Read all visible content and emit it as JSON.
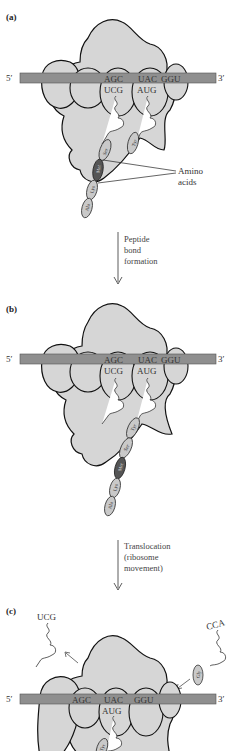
{
  "colors": {
    "ribosome_fill": "#d6d6d6",
    "ribosome_stroke": "#111111",
    "mrna_fill": "#8f8f8f",
    "mrna_stroke": "#555555",
    "amino_fill": "#c9c9c9",
    "met_fill": "#555555",
    "trna_fill": "#ffffff",
    "text": "#333333"
  },
  "panels": [
    {
      "label": "(a)",
      "mrna": {
        "five_prime": "5′",
        "three_prime": "3′"
      },
      "codons": [
        "AGC",
        "UAC",
        "GGU"
      ],
      "anticodons": [
        "UCG",
        "AUG"
      ],
      "chain_amino_acids": [
        "Ser",
        "Met",
        "Lys",
        "Ala"
      ],
      "incoming_amino_acid": "Tyr",
      "callout": "Amino\nacids",
      "callout_lines": [
        "Amino",
        "acids"
      ]
    },
    {
      "label": "(b)",
      "mrna": {
        "five_prime": "5′",
        "three_prime": "3′"
      },
      "codons": [
        "AGC",
        "UAC",
        "GGU"
      ],
      "anticodons": [
        "UCG",
        "AUG"
      ],
      "chain_amino_acids": [
        "Tyr",
        "Ser",
        "Met",
        "Lys",
        "Ala"
      ]
    },
    {
      "label": "(c)",
      "mrna": {
        "five_prime": "5′",
        "three_prime": "3′"
      },
      "codons": [
        "AGC",
        "UAC",
        "GGU"
      ],
      "anticodons": [
        "AUG"
      ],
      "released_trna_anticodon": "UCG",
      "incoming_trna_anticodon": "CCA",
      "incoming_amino_acid": "Gly",
      "chain_amino_acids": [
        "Tyr"
      ]
    }
  ],
  "steps": [
    {
      "lines": [
        "Peptide",
        "bond",
        "formation"
      ]
    },
    {
      "lines": [
        "Translocation",
        "(ribosome",
        "movement)"
      ]
    }
  ]
}
